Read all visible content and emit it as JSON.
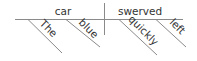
{
  "diagram": {
    "type": "sentence-diagram",
    "sentence": "The blue car swerved quickly left",
    "subject": "car",
    "predicate": "swerved",
    "subject_modifiers": [
      "The",
      "blue"
    ],
    "predicate_modifiers": [
      "quickly",
      "left"
    ],
    "colors": {
      "line": "#8a8a8a",
      "text": "#333333",
      "background": "#ffffff"
    }
  }
}
